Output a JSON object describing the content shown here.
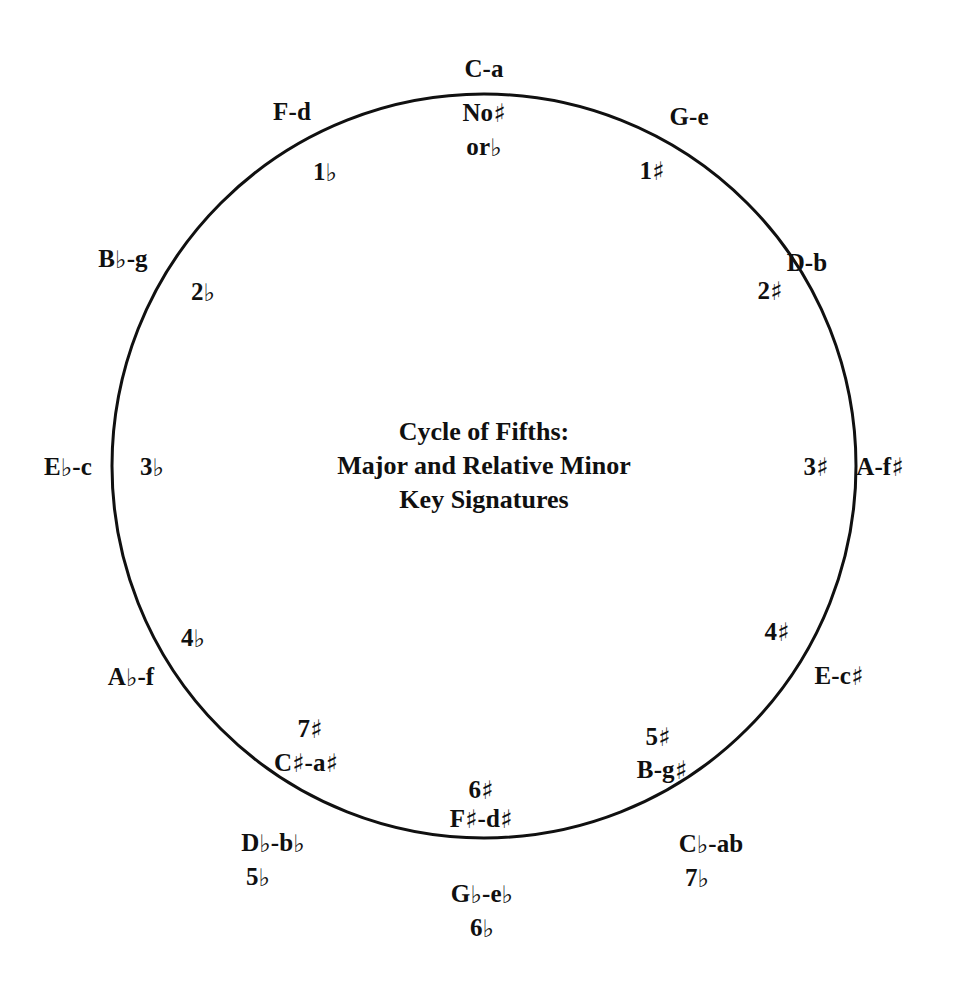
{
  "diagram": {
    "title_lines": [
      "Cycle of Fifths:",
      "Major and Relative Minor",
      "Key Signatures"
    ],
    "circle": {
      "center_x": 484,
      "center_y": 466,
      "radius": 372,
      "stroke": "#101010",
      "stroke_width": 3,
      "fill": "none"
    },
    "background_color": "#ffffff",
    "text_color": "#101010",
    "outer_labels": [
      {
        "name": "c-major-a-minor",
        "text": "C-a",
        "x": 484,
        "y": 68
      },
      {
        "name": "g-major-e-minor",
        "text": "G-e",
        "x": 689,
        "y": 116
      },
      {
        "name": "d-major-b-minor",
        "text": "D-b",
        "x": 807,
        "y": 262
      },
      {
        "name": "a-major-f-sharp-minor",
        "text": "A-f♯",
        "x": 880,
        "y": 466
      },
      {
        "name": "e-major-c-sharp-minor",
        "text": "E-c♯",
        "x": 839,
        "y": 675
      },
      {
        "name": "b-major-g-sharp-minor",
        "text": "C♭-ab",
        "x": 711,
        "y": 843
      },
      {
        "name": "c-flat-a-flat-count",
        "text": "7♭",
        "x": 697,
        "y": 877
      },
      {
        "name": "g-flat-e-flat-minor",
        "text": "G♭-e♭",
        "x": 482,
        "y": 893
      },
      {
        "name": "g-flat-count",
        "text": "6♭",
        "x": 482,
        "y": 927
      },
      {
        "name": "d-flat-b-flat-minor",
        "text": "D♭-b♭",
        "x": 273,
        "y": 842
      },
      {
        "name": "d-flat-count",
        "text": "5♭",
        "x": 258,
        "y": 876
      },
      {
        "name": "a-flat-f-minor",
        "text": "A♭-f",
        "x": 131,
        "y": 676
      },
      {
        "name": "e-flat-c-minor",
        "text": "E♭-c",
        "x": 68,
        "y": 466
      },
      {
        "name": "b-flat-g-minor",
        "text": "B♭-g",
        "x": 123,
        "y": 258
      },
      {
        "name": "f-major-d-minor",
        "text": "F-d",
        "x": 292,
        "y": 111
      }
    ],
    "inner_labels": [
      {
        "name": "c-no-accidentals-line1",
        "text": "No♯",
        "x": 484,
        "y": 112
      },
      {
        "name": "c-no-accidentals-line2",
        "text": "or♭",
        "x": 484,
        "y": 146
      },
      {
        "name": "g-one-sharp",
        "text": "1♯",
        "x": 652,
        "y": 170
      },
      {
        "name": "d-two-sharps",
        "text": "2♯",
        "x": 770,
        "y": 290
      },
      {
        "name": "a-three-sharps",
        "text": "3♯",
        "x": 816,
        "y": 466
      },
      {
        "name": "e-four-sharps",
        "text": "4♯",
        "x": 777,
        "y": 631
      },
      {
        "name": "b-five-sharps",
        "text": "5♯",
        "x": 658,
        "y": 736
      },
      {
        "name": "b-major-g-sharp-minor-inner",
        "text": "B-g♯",
        "x": 662,
        "y": 769
      },
      {
        "name": "f-sharp-six-sharps",
        "text": "6♯",
        "x": 481,
        "y": 789
      },
      {
        "name": "f-sharp-d-sharp-inner",
        "text": "F♯-d♯",
        "x": 481,
        "y": 818
      },
      {
        "name": "c-sharp-seven-sharps",
        "text": "7♯",
        "x": 310,
        "y": 728
      },
      {
        "name": "c-sharp-a-sharp-inner",
        "text": "C♯-a♯",
        "x": 306,
        "y": 762
      },
      {
        "name": "a-flat-four-flats",
        "text": "4♭",
        "x": 193,
        "y": 637
      },
      {
        "name": "e-flat-three-flats",
        "text": "3♭",
        "x": 152,
        "y": 466
      },
      {
        "name": "b-flat-two-flats",
        "text": "2♭",
        "x": 203,
        "y": 291
      },
      {
        "name": "f-one-flat",
        "text": "1♭",
        "x": 325,
        "y": 171
      }
    ]
  }
}
